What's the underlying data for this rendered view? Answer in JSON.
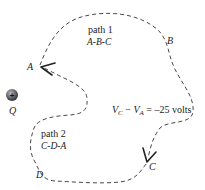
{
  "diagram": {
    "charge": {
      "symbol": "+",
      "label": "Q"
    },
    "points": {
      "A": "A",
      "B": "B",
      "C": "C",
      "D": "D"
    },
    "path1": {
      "title": "path 1",
      "route": "A-B-C"
    },
    "path2": {
      "title": "path 2",
      "route": "C-D-A"
    },
    "equation": {
      "v1": "V",
      "s1": "C",
      "minus": " − ",
      "v2": "V",
      "s2": "A",
      "rhs": " = –25 volts"
    },
    "colors": {
      "line": "#333333",
      "charge": "#555555",
      "text": "#222222"
    }
  }
}
